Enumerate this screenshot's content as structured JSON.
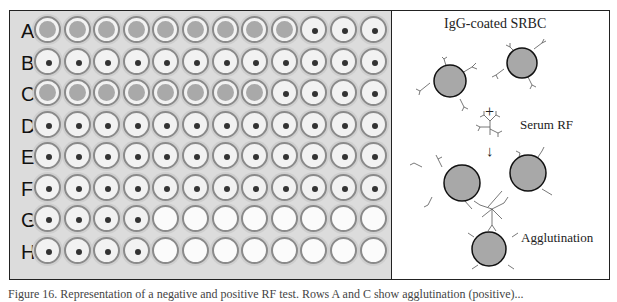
{
  "plate": {
    "rows": [
      "A",
      "B",
      "C",
      "D",
      "E",
      "F",
      "G",
      "H"
    ],
    "columns": 12,
    "wells": {
      "A": [
        "diffuse",
        "diffuse",
        "diffuse",
        "diffuse",
        "diffuse",
        "diffuse",
        "diffuse",
        "diffuse",
        "diffuse",
        "button",
        "button",
        "button"
      ],
      "B": [
        "button",
        "button",
        "button",
        "button",
        "button",
        "button",
        "button",
        "button",
        "button",
        "button",
        "button",
        "button"
      ],
      "C": [
        "diffuse",
        "diffuse",
        "diffuse",
        "diffuse",
        "diffuse",
        "diffuse",
        "diffuse",
        "diffuse",
        "button",
        "button",
        "button",
        "button"
      ],
      "D": [
        "button",
        "button",
        "button",
        "button",
        "button",
        "button",
        "button",
        "button",
        "button",
        "button",
        "button",
        "button"
      ],
      "E": [
        "button",
        "button",
        "button",
        "button",
        "button",
        "button",
        "button",
        "button",
        "button",
        "button",
        "button",
        "button"
      ],
      "F": [
        "button",
        "button",
        "button",
        "button",
        "button",
        "button",
        "button",
        "button",
        "button",
        "button",
        "button",
        "button"
      ],
      "G": [
        "button",
        "button",
        "button",
        "button",
        "empty",
        "empty",
        "empty",
        "empty",
        "empty",
        "empty",
        "empty",
        "empty"
      ],
      "H": [
        "button",
        "button",
        "button",
        "button",
        "empty",
        "empty",
        "empty",
        "empty",
        "empty",
        "empty",
        "empty",
        "empty"
      ]
    }
  },
  "diagram": {
    "title": "IgG-coated SRBC",
    "plus": "+",
    "reagent_label": "Serum RF",
    "arrow": "↓",
    "result_label": "Agglutination",
    "cell_color": "#a8a8a8"
  },
  "caption": "Figure 16. Representation of a negative and positive RF test. Rows A and C show agglutination (positive)..."
}
